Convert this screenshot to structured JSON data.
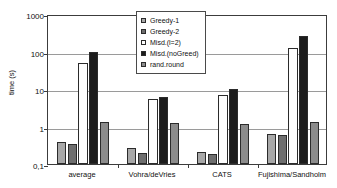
{
  "chart_data": {
    "type": "bar",
    "title": "",
    "xlabel": "",
    "ylabel": "time (s)",
    "yscale": "log",
    "ylim": [
      0.1,
      1000
    ],
    "ytick_labels": [
      "1000",
      "100",
      "10",
      "1",
      "0,1"
    ],
    "ytick_values": [
      1000,
      100,
      10,
      1,
      0.1
    ],
    "grid": true,
    "legend_position": "upper-center",
    "categories": [
      "average",
      "Vohra/deVries",
      "CATS",
      "Fujishima/Sandholm"
    ],
    "series": [
      {
        "name": "Greedy-1",
        "values": [
          0.38,
          0.26,
          0.21,
          0.63
        ]
      },
      {
        "name": "Greedy-2",
        "values": [
          0.35,
          0.2,
          0.19,
          0.59
        ]
      },
      {
        "name": "Misd.(l=2)",
        "values": [
          50,
          5.5,
          7.0,
          125
        ]
      },
      {
        "name": "Misd.(noGreed)",
        "values": [
          100,
          6.0,
          10.0,
          260
        ]
      },
      {
        "name": "rand.round",
        "values": [
          1.3,
          1.25,
          1.2,
          1.3
        ]
      }
    ],
    "series_colors": [
      "#a8a8a8",
      "#6e6e6e",
      "#fdfdfd",
      "#1c1c1c",
      "#8c8c8c"
    ]
  }
}
